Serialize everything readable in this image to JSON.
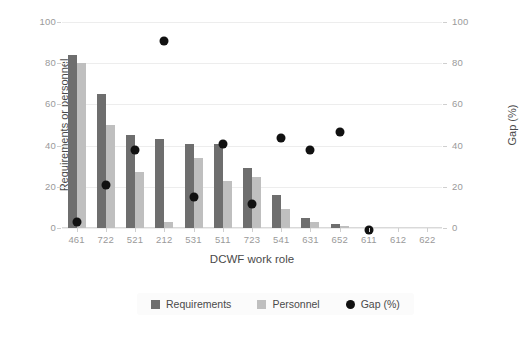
{
  "chart_data": {
    "type": "bar",
    "title": "",
    "xlabel": "DCWF work role",
    "ylabel": "Requirements or personnel",
    "y2label": "Gap (%)",
    "categories": [
      "461",
      "722",
      "521",
      "212",
      "531",
      "511",
      "723",
      "541",
      "631",
      "652",
      "611",
      "612",
      "622"
    ],
    "ylim": [
      0,
      100
    ],
    "y2lim": [
      0,
      100
    ],
    "yticks": [
      "0",
      "20",
      "40",
      "60",
      "80",
      "100"
    ],
    "y2ticks": [
      "0",
      "20",
      "40",
      "60",
      "80",
      "100"
    ],
    "grid": true,
    "legend_position": "bottom-center",
    "series": [
      {
        "name": "Requirements",
        "type": "bar",
        "color": "#6e6e6e",
        "axis": "left",
        "values": [
          84,
          65,
          45,
          43,
          41,
          41,
          29,
          16,
          5,
          2,
          0,
          0,
          0
        ]
      },
      {
        "name": "Personnel",
        "type": "bar",
        "color": "#bfbfbf",
        "axis": "left",
        "values": [
          80,
          50,
          27,
          3,
          34,
          23,
          25,
          9,
          3,
          1,
          0,
          0,
          0
        ]
      },
      {
        "name": "Gap (%)",
        "type": "scatter",
        "color": "#111111",
        "axis": "right",
        "values": [
          5,
          23,
          40,
          93,
          17,
          43,
          14,
          46,
          40,
          49,
          1,
          null,
          null
        ]
      }
    ]
  },
  "legend": {
    "items": [
      {
        "label": "Requirements",
        "marker": "square",
        "color": "#6e6e6e"
      },
      {
        "label": "Personnel",
        "marker": "square",
        "color": "#bfbfbf"
      },
      {
        "label": "Gap (%)",
        "marker": "circle",
        "color": "#111111"
      }
    ]
  }
}
